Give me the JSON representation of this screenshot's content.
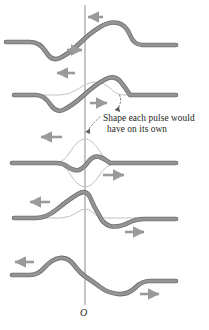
{
  "figure": {
    "type": "physics-diagram",
    "width": 209,
    "height": 330,
    "background_color": "#ffffff"
  },
  "annotation": {
    "line1": "Shape each pulse would",
    "line2": "have on its own",
    "leader_style": "dotted-curved"
  },
  "axis": {
    "origin_label": "O",
    "x": 85,
    "y_top": 5,
    "y_bottom": 305,
    "color": "#8c8c8c"
  },
  "colors": {
    "pulse_thick": "#8a8a8a",
    "pulse_thick_edge": "#6e6e6e",
    "pulse_thin": "#b9b9b9",
    "axis": "#8c8c8c",
    "arrow": "#9a9a9a",
    "text": "#231f20",
    "leader": "#6b6b6b"
  },
  "panels": [
    {
      "index": 1,
      "name": "panel-approaching",
      "baseline_y": 42,
      "description": "Two pulses approaching: downward pulse moving right, upward pulse moving left, still separated",
      "arrows": [
        {
          "name": "arrow-left-top",
          "direction": "left",
          "x": 89,
          "y": 17
        },
        {
          "name": "arrow-right-top",
          "direction": "right",
          "x": 81,
          "y": 50
        }
      ]
    },
    {
      "index": 2,
      "name": "panel-beginning-overlap",
      "baseline_y": 95,
      "description": "Pulses beginning to overlap near the origin; thin curve shows individual pulse shape",
      "arrows": [
        {
          "name": "arrow-left-upper",
          "direction": "left",
          "x": 60,
          "y": 73
        },
        {
          "name": "arrow-right-lower",
          "direction": "right",
          "x": 93,
          "y": 103
        }
      ]
    },
    {
      "index": 3,
      "name": "panel-full-overlap",
      "baseline_y": 163,
      "description": "Maximum overlap: the two pulses nearly cancel, leaving a small resultant; thin curves show both individual pulse shapes",
      "arrows": [
        {
          "name": "arrow-left-middle",
          "direction": "left",
          "x": 44,
          "y": 137
        },
        {
          "name": "arrow-right-middle",
          "direction": "right",
          "x": 105,
          "y": 175
        }
      ]
    },
    {
      "index": 4,
      "name": "panel-separating",
      "baseline_y": 218,
      "description": "Pulses separating again; crest now on the left, trough on the right",
      "arrows": [
        {
          "name": "arrow-left-lower",
          "direction": "left",
          "x": 33,
          "y": 202
        },
        {
          "name": "arrow-right-upper",
          "direction": "right",
          "x": 128,
          "y": 232
        }
      ]
    },
    {
      "index": 5,
      "name": "panel-passed-through",
      "baseline_y": 275,
      "description": "Pulses have passed through each other and resumed their original shapes travelling in opposite directions",
      "arrows": [
        {
          "name": "arrow-left-bottom",
          "direction": "left",
          "x": 17,
          "y": 262
        },
        {
          "name": "arrow-right-bottom",
          "direction": "right",
          "x": 143,
          "y": 294
        }
      ]
    }
  ]
}
